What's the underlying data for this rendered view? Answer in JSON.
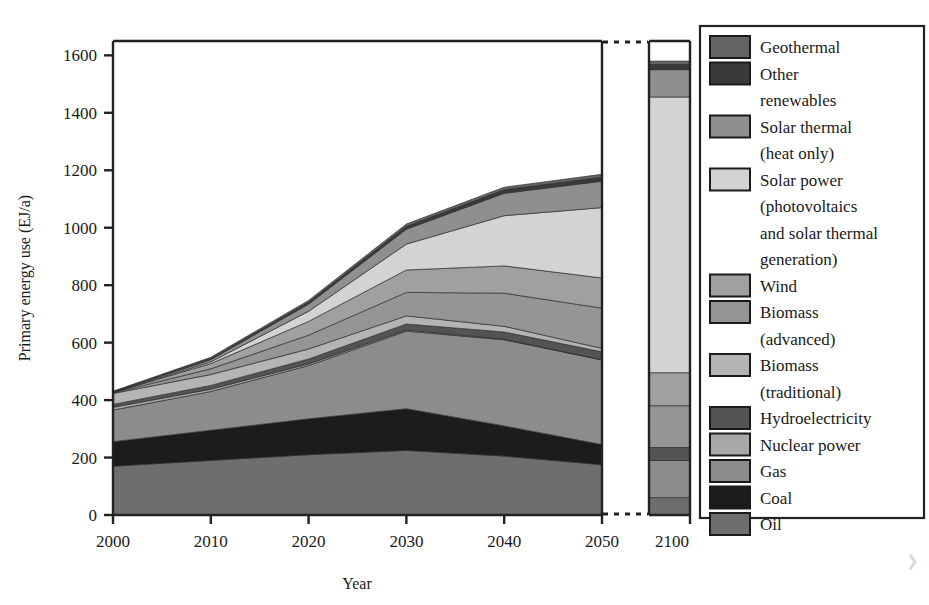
{
  "chart_data": {
    "type": "area",
    "title": "",
    "xlabel": "Year",
    "ylabel": "Primary energy use (EJ/a)",
    "x": [
      2000,
      2010,
      2020,
      2030,
      2040,
      2050
    ],
    "xticklabels": [
      "2000",
      "2010",
      "2020",
      "2030",
      "2040",
      "2050"
    ],
    "extra_x": [
      2100
    ],
    "extra_xticklabels": [
      "2100"
    ],
    "axis_break": true,
    "ylim": [
      0,
      1650
    ],
    "yticks": [
      0,
      200,
      400,
      600,
      800,
      1000,
      1200,
      1400,
      1600
    ],
    "yticklabels": [
      "0",
      "200",
      "400",
      "600",
      "800",
      "1000",
      "1200",
      "1400",
      "1600"
    ],
    "grid": false,
    "legend_position": "right",
    "stack_order_bottom_to_top": [
      "Oil",
      "Coal",
      "Gas",
      "Nuclear power",
      "Hydroelectricity",
      "Biomass (traditional)",
      "Biomass (advanced)",
      "Wind",
      "Solar power (photovoltaics and solar thermal generation)",
      "Solar thermal (heat only)",
      "Other renewables",
      "Geothermal"
    ],
    "series": [
      {
        "name": "Oil",
        "color": "#6e6e6e",
        "values": [
          170,
          190,
          210,
          225,
          205,
          175
        ],
        "value_2100": 60
      },
      {
        "name": "Coal",
        "color": "#1c1c1c",
        "values": [
          85,
          105,
          125,
          145,
          105,
          70
        ],
        "value_2100": 0
      },
      {
        "name": "Gas",
        "color": "#8c8c8c",
        "values": [
          110,
          135,
          185,
          270,
          300,
          295
        ],
        "value_2100": 130
      },
      {
        "name": "Nuclear power",
        "color": "#a8a8a8",
        "values": [
          10,
          8,
          6,
          4,
          2,
          0
        ],
        "value_2100": 0
      },
      {
        "name": "Hydroelectricity",
        "color": "#545454",
        "values": [
          10,
          13,
          17,
          21,
          25,
          28
        ],
        "value_2100": 45
      },
      {
        "name": "Biomass (traditional)",
        "color": "#b4b4b4",
        "values": [
          38,
          38,
          35,
          28,
          20,
          12
        ],
        "value_2100": 0
      },
      {
        "name": "Biomass (advanced)",
        "color": "#959595",
        "values": [
          2,
          20,
          48,
          82,
          115,
          140
        ],
        "value_2100": 145
      },
      {
        "name": "Wind",
        "color": "#a0a0a0",
        "values": [
          1,
          18,
          48,
          78,
          95,
          105
        ],
        "value_2100": 115
      },
      {
        "name": "Solar power (photovoltaics and solar thermal generation)",
        "color": "#d3d3d3",
        "values": [
          0,
          6,
          35,
          90,
          175,
          245
        ],
        "value_2100": 960
      },
      {
        "name": "Solar thermal (heat only)",
        "color": "#8f8f8f",
        "values": [
          1,
          8,
          25,
          52,
          78,
          92
        ],
        "value_2100": 95
      },
      {
        "name": "Other renewables",
        "color": "#3a3a3a",
        "values": [
          2,
          4,
          7,
          10,
          12,
          14
        ],
        "value_2100": 18
      },
      {
        "name": "Geothermal",
        "color": "#636363",
        "values": [
          2,
          4,
          6,
          8,
          9,
          10
        ],
        "value_2100": 12
      }
    ],
    "totals": [
      431,
      549,
      747,
      1013,
      1141,
      1186
    ],
    "total_2100": 1580
  },
  "legend": {
    "items": [
      {
        "label": "Geothermal",
        "color": "#636363"
      },
      {
        "label": "Other renewables",
        "color": "#3a3a3a"
      },
      {
        "label": "Solar thermal (heat only)",
        "color": "#8f8f8f"
      },
      {
        "label": "Solar power (photovoltaics and solar thermal generation)",
        "color": "#d3d3d3"
      },
      {
        "label": "Wind",
        "color": "#a0a0a0"
      },
      {
        "label": "Biomass (advanced)",
        "color": "#959595"
      },
      {
        "label": "Biomass (traditional)",
        "color": "#b4b4b4"
      },
      {
        "label": "Hydroelectricity",
        "color": "#545454"
      },
      {
        "label": "Nuclear power",
        "color": "#a8a8a8"
      },
      {
        "label": "Gas",
        "color": "#8c8c8c"
      },
      {
        "label": "Coal",
        "color": "#1c1c1c"
      },
      {
        "label": "Oil",
        "color": "#6e6e6e"
      }
    ],
    "wrapped_lines": [
      [
        "Geothermal"
      ],
      [
        "Other",
        "renewables"
      ],
      [
        "Solar thermal",
        "(heat only)"
      ],
      [
        "Solar power",
        "(photovoltaics",
        "and solar thermal",
        "generation)"
      ],
      [
        "Wind"
      ],
      [
        "Biomass",
        "(advanced)"
      ],
      [
        "Biomass",
        "(traditional)"
      ],
      [
        "Hydroelectricity"
      ],
      [
        "Nuclear power"
      ],
      [
        "Gas"
      ],
      [
        "Coal"
      ],
      [
        "Oil"
      ]
    ]
  },
  "colors": {
    "axis": "#222222",
    "frame": "#222222",
    "background": "#ffffff",
    "text": "#1a1a1a"
  }
}
